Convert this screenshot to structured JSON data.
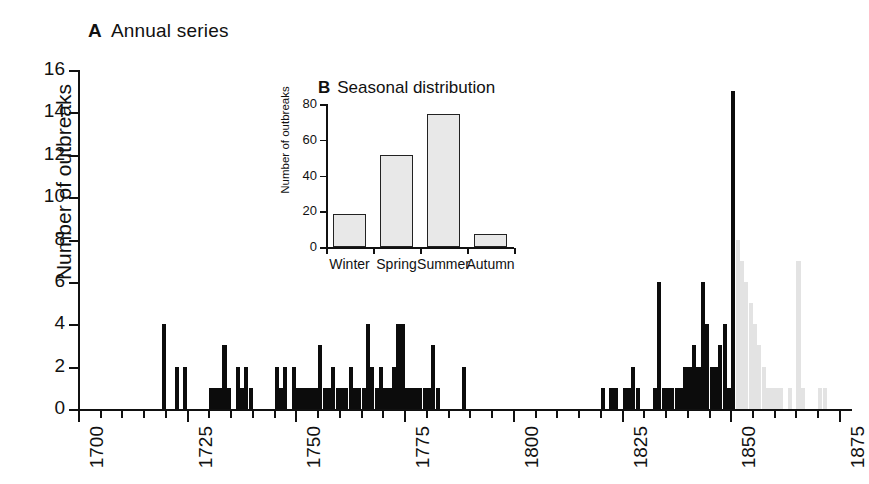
{
  "panelA": {
    "label": "A",
    "title": "Annual series",
    "ylabel": "Number of outbreaks"
  },
  "panelB": {
    "label": "B",
    "title": "Seasonal distribution",
    "ylabel": "Number of outbreaks"
  },
  "chart_data": [
    {
      "type": "bar",
      "title": "A  Annual series",
      "xlabel": "",
      "ylabel": "Number of outbreaks",
      "xlim": [
        1700,
        1878
      ],
      "ylim": [
        0,
        16
      ],
      "yticks": [
        0,
        2,
        4,
        6,
        8,
        10,
        12,
        14,
        16
      ],
      "xticks": [
        1700,
        1725,
        1750,
        1775,
        1800,
        1825,
        1850,
        1875
      ],
      "xtick_labels": [
        "1700",
        "1725",
        "1750",
        "1775",
        "1800",
        "1825",
        "1850",
        "1875"
      ],
      "minor_tick_interval": 5,
      "grid": false,
      "legend": "none",
      "note": "Solid black bars = observed record 1700-1850; light grey bars after 1850 are faded/greyed out.",
      "x": [
        1700,
        1701,
        1702,
        1703,
        1704,
        1705,
        1706,
        1707,
        1708,
        1709,
        1710,
        1711,
        1712,
        1713,
        1714,
        1715,
        1716,
        1717,
        1718,
        1719,
        1720,
        1721,
        1722,
        1723,
        1724,
        1725,
        1726,
        1727,
        1728,
        1729,
        1730,
        1731,
        1732,
        1733,
        1734,
        1735,
        1736,
        1737,
        1738,
        1739,
        1740,
        1741,
        1742,
        1743,
        1744,
        1745,
        1746,
        1747,
        1748,
        1749,
        1750,
        1751,
        1752,
        1753,
        1754,
        1755,
        1756,
        1757,
        1758,
        1759,
        1760,
        1761,
        1762,
        1763,
        1764,
        1765,
        1766,
        1767,
        1768,
        1769,
        1770,
        1771,
        1772,
        1773,
        1774,
        1775,
        1776,
        1777,
        1778,
        1779,
        1780,
        1781,
        1782,
        1783,
        1784,
        1785,
        1786,
        1787,
        1788,
        1789,
        1790,
        1791,
        1792,
        1793,
        1794,
        1795,
        1796,
        1797,
        1798,
        1799,
        1800,
        1801,
        1802,
        1803,
        1804,
        1805,
        1806,
        1807,
        1808,
        1809,
        1810,
        1811,
        1812,
        1813,
        1814,
        1815,
        1816,
        1817,
        1818,
        1819,
        1820,
        1821,
        1822,
        1823,
        1824,
        1825,
        1826,
        1827,
        1828,
        1829,
        1830,
        1831,
        1832,
        1833,
        1834,
        1835,
        1836,
        1837,
        1838,
        1839,
        1840,
        1841,
        1842,
        1843,
        1844,
        1845,
        1846,
        1847,
        1848,
        1849,
        1850,
        1851,
        1852,
        1853,
        1854,
        1855,
        1856,
        1857,
        1858,
        1859,
        1860,
        1861,
        1862,
        1863,
        1864,
        1865,
        1866,
        1867,
        1868,
        1869,
        1870,
        1871,
        1872,
        1873,
        1874,
        1875,
        1876,
        1877
      ],
      "values": [
        0,
        0,
        0,
        0,
        0,
        0,
        0,
        0,
        0,
        0,
        0,
        0,
        0,
        0,
        0,
        0,
        0,
        0,
        0,
        4,
        0,
        0,
        2,
        0,
        2,
        0,
        0,
        0,
        0,
        0,
        1,
        1,
        1,
        3,
        1,
        0,
        2,
        1,
        2,
        1,
        0,
        0,
        0,
        0,
        0,
        2,
        1,
        2,
        0,
        2,
        1,
        1,
        1,
        1,
        1,
        3,
        1,
        1,
        2,
        1,
        1,
        1,
        2,
        1,
        1,
        1,
        4,
        2,
        1,
        2,
        1,
        1,
        2,
        4,
        4,
        1,
        1,
        1,
        1,
        1,
        1,
        3,
        1,
        0,
        0,
        0,
        0,
        0,
        2,
        0,
        0,
        0,
        0,
        0,
        0,
        0,
        0,
        0,
        0,
        0,
        0,
        0,
        0,
        0,
        0,
        0,
        0,
        0,
        0,
        0,
        0,
        0,
        0,
        0,
        0,
        0,
        0,
        0,
        0,
        0,
        1,
        0,
        1,
        1,
        0,
        1,
        1,
        2,
        1,
        0,
        0,
        0,
        1,
        6,
        1,
        1,
        1,
        1,
        1,
        2,
        2,
        3,
        2,
        6,
        4,
        2,
        2,
        3,
        4,
        1,
        15,
        0,
        0,
        0,
        0,
        0,
        0,
        0,
        0,
        0,
        0,
        0,
        0,
        0,
        0,
        0,
        0,
        0,
        0,
        0,
        0,
        0,
        0,
        0,
        0,
        0,
        0,
        0
      ],
      "faded_x": [
        1851,
        1852,
        1853,
        1854,
        1855,
        1856,
        1857,
        1858,
        1859,
        1860,
        1861,
        1862,
        1863,
        1864,
        1865,
        1866,
        1867,
        1868,
        1869,
        1870,
        1871,
        1872,
        1873,
        1874,
        1875
      ],
      "faded_values": [
        8,
        7,
        6,
        5,
        4,
        3,
        2,
        1,
        1,
        1,
        1,
        0,
        1,
        0,
        7,
        1,
        0,
        0,
        0,
        1,
        1,
        0,
        0,
        0,
        0
      ]
    },
    {
      "type": "bar",
      "title": "B  Seasonal distribution",
      "xlabel": "",
      "ylabel": "Number of outbreaks",
      "categories": [
        "Winter",
        "Spring",
        "Summer",
        "Autumn"
      ],
      "values": [
        18,
        51,
        74,
        7
      ],
      "ylim": [
        0,
        80
      ],
      "yticks": [
        0,
        20,
        40,
        60,
        80
      ],
      "grid": false,
      "legend": "none"
    }
  ],
  "colors": {
    "bar_solid": "#0c0c0c",
    "bar_faded": "#e3e3e3",
    "inset_bar_fill": "#e8e8e8",
    "inset_bar_stroke": "#222222",
    "axis": "#111111",
    "background": "#ffffff"
  }
}
